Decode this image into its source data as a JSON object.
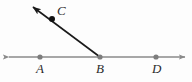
{
  "figure": {
    "background_color": "#fdfdfd",
    "canvas": {
      "width": 192,
      "height": 82
    }
  },
  "labels": {
    "a": "A",
    "b": "B",
    "c": "C",
    "d": "D"
  },
  "points": [
    {
      "name": "A",
      "label": "A",
      "x": 40,
      "y": 57,
      "color": "#7d7d7d",
      "radius": 2.6,
      "filled": true
    },
    {
      "name": "B",
      "label": "B",
      "x": 100,
      "y": 57,
      "color": "#7d7d7d",
      "radius": 2.6,
      "filled": true
    },
    {
      "name": "D",
      "label": "D",
      "x": 156,
      "y": 57,
      "color": "#7d7d7d",
      "radius": 2.6,
      "filled": true
    },
    {
      "name": "C",
      "label": "C",
      "x": 52,
      "y": 19,
      "color": "#111111",
      "radius": 3.0,
      "filled": true
    }
  ],
  "lines": [
    {
      "name": "horizontal-line-AD",
      "from": {
        "x": 9,
        "y": 57
      },
      "to": {
        "x": 185,
        "y": 57
      },
      "color": "#8a8a8a",
      "width": 1.4,
      "arrow_start": true,
      "arrow_end": true
    },
    {
      "name": "ray-BC",
      "from": {
        "x": 100,
        "y": 57
      },
      "to": {
        "x": 31,
        "y": 5
      },
      "color": "#1a1a1a",
      "width": 1.6,
      "arrow_start": false,
      "arrow_end": true
    }
  ],
  "colors": {
    "line_gray": "#8a8a8a",
    "ray_black": "#1a1a1a",
    "point_gray": "#7d7d7d",
    "point_black": "#111111",
    "label_text": "#2b2b2b",
    "background": "#fdfdfd"
  }
}
